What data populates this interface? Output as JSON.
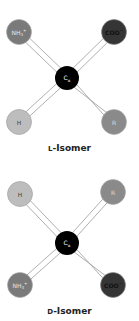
{
  "figure": {
    "isomers": [
      {
        "name": "L-Isomer",
        "caption_prefix": "L",
        "caption_suffix": "-Isomer",
        "center": {
          "label": "Cα",
          "label_main": "C",
          "label_sub": "α",
          "color": "#000000"
        },
        "groups": {
          "top_left": {
            "label": "NH3+",
            "main": "NH",
            "sub": "3",
            "sup": "+",
            "color": "#7a7a7a"
          },
          "top_right": {
            "label": "COO−",
            "main": "COO",
            "sup": "−",
            "color": "#353535"
          },
          "bottom_left": {
            "label": "H",
            "main": "H",
            "color": "#bdbdbd"
          },
          "bottom_right": {
            "label": "R",
            "main": "R",
            "color": "#8a8a8a"
          }
        }
      },
      {
        "name": "D-Isomer",
        "caption_prefix": "D",
        "caption_suffix": "-Isomer",
        "center": {
          "label": "Cα",
          "label_main": "C",
          "label_sub": "α",
          "color": "#000000"
        },
        "groups": {
          "top_left": {
            "label": "H",
            "main": "H",
            "color": "#bdbdbd"
          },
          "top_right": {
            "label": "R",
            "main": "R",
            "color": "#8a8a8a"
          },
          "bottom_left": {
            "label": "NH3+",
            "main": "NH",
            "sub": "3",
            "sup": "+",
            "color": "#7a7a7a"
          },
          "bottom_right": {
            "label": "COO−",
            "main": "COO",
            "sup": "−",
            "color": "#353535"
          }
        }
      }
    ]
  }
}
